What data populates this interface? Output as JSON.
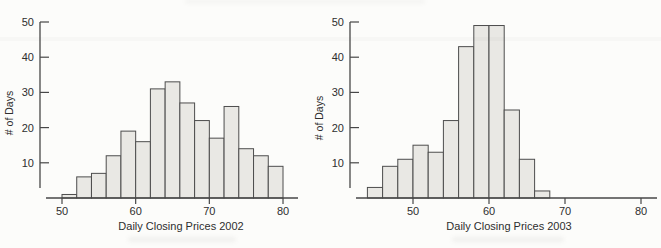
{
  "figure_alt": "Two histograms of daily closing prices for 2002 and 2003",
  "colors": {
    "background": "#fcfcfa",
    "bar_fill": "#e9e8e4",
    "bar_stroke": "#4d4d4d",
    "axis": "#474747",
    "text": "#2e2e2e"
  },
  "chart_data": [
    {
      "type": "bar",
      "subtype": "histogram",
      "title": "",
      "xlabel": "Daily Closing Prices 2002",
      "ylabel": "# of Days",
      "bin_width": 2,
      "bin_edges": [
        50,
        52,
        54,
        56,
        58,
        60,
        62,
        64,
        66,
        68,
        70,
        72,
        74,
        76,
        78,
        80
      ],
      "values": [
        1,
        6,
        7,
        12,
        19,
        16,
        31,
        33,
        27,
        22,
        17,
        26,
        14,
        12,
        9
      ],
      "x_ticks": [
        50,
        60,
        70,
        80
      ],
      "y_ticks": [
        10,
        20,
        30,
        40,
        50
      ],
      "xlim": [
        48,
        82
      ],
      "ylim": [
        0,
        50
      ],
      "grid": false,
      "legend": null
    },
    {
      "type": "bar",
      "subtype": "histogram",
      "title": "",
      "xlabel": "Daily Closing Prices 2003",
      "ylabel": "# of Days",
      "bin_width": 2,
      "bin_edges": [
        44,
        46,
        48,
        50,
        52,
        54,
        56,
        58,
        60,
        62,
        64,
        66,
        68
      ],
      "values": [
        3,
        9,
        11,
        15,
        13,
        22,
        43,
        49,
        49,
        25,
        11,
        2
      ],
      "x_ticks": [
        50,
        60,
        70,
        80
      ],
      "y_ticks": [
        10,
        20,
        30,
        40,
        50
      ],
      "xlim": [
        42,
        82
      ],
      "ylim": [
        0,
        50
      ],
      "grid": false,
      "legend": null
    }
  ]
}
